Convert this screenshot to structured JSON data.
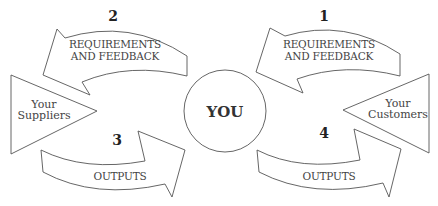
{
  "diagram": {
    "center": {
      "label": "YOU"
    },
    "left_party": {
      "line1": "Your",
      "line2": "Suppliers"
    },
    "right_party": {
      "line1": "Your",
      "line2": "Customers"
    },
    "arrows": [
      {
        "step": "1",
        "line1": "REQUIREMENTS",
        "line2": "AND FEEDBACK",
        "direction": "customers-to-you"
      },
      {
        "step": "2",
        "line1": "REQUIREMENTS",
        "line2": "AND FEEDBACK",
        "direction": "you-to-suppliers"
      },
      {
        "step": "3",
        "line1": "OUTPUTS",
        "direction": "suppliers-to-you"
      },
      {
        "step": "4",
        "line1": "OUTPUTS",
        "direction": "you-to-customers"
      }
    ],
    "colors": {
      "stroke": "#555555",
      "text": "#444444",
      "background": "#ffffff"
    }
  }
}
